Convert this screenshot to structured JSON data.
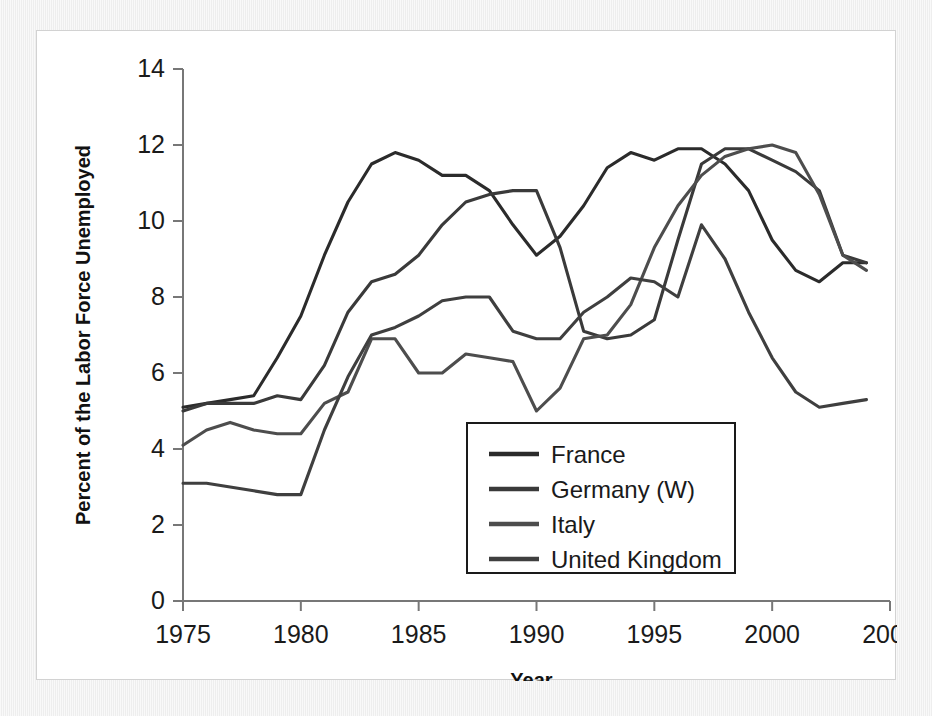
{
  "figure": {
    "background_color": "#ffffff",
    "page_color": "#f2f2f2",
    "frame_color": "#d2d2d2"
  },
  "chart_data": {
    "type": "line",
    "title": "",
    "subtitle": "",
    "xlabel": "Year",
    "ylabel": "Percent of the Labor Force Unemployed",
    "xlim": [
      1975,
      2005
    ],
    "ylim": [
      0,
      14
    ],
    "xticks": [
      1975,
      1980,
      1985,
      1990,
      1995,
      2000,
      2005
    ],
    "xtick_labels": [
      "1975",
      "1980",
      "1985",
      "1990",
      "1995",
      "2000",
      "2005"
    ],
    "yticks": [
      0,
      2,
      4,
      6,
      8,
      10,
      12,
      14
    ],
    "ytick_labels": [
      "0",
      "2",
      "4",
      "6",
      "8",
      "10",
      "12",
      "14"
    ],
    "grid": false,
    "legend_position": "lower right",
    "x": [
      1975,
      1976,
      1977,
      1978,
      1979,
      1980,
      1981,
      1982,
      1983,
      1984,
      1985,
      1986,
      1987,
      1988,
      1989,
      1990,
      1991,
      1992,
      1993,
      1994,
      1995,
      1996,
      1997,
      1998,
      1999,
      2000,
      2001,
      2002,
      2003,
      2004
    ],
    "series": [
      {
        "name": "France",
        "color": "#2b2b2b",
        "values": [
          5.1,
          5.2,
          5.3,
          5.4,
          6.4,
          7.5,
          9.1,
          10.5,
          11.5,
          11.8,
          11.6,
          11.2,
          11.2,
          10.8,
          9.9,
          9.1,
          9.6,
          10.4,
          11.4,
          11.8,
          11.6,
          11.9,
          11.9,
          11.5,
          10.8,
          9.5,
          8.7,
          8.4,
          8.9,
          8.9
        ],
        "linewidth": 3.1,
        "dash": "none"
      },
      {
        "name": "Germany (W)",
        "color": "#3a3a3a",
        "values": [
          5.0,
          5.2,
          5.2,
          5.2,
          5.4,
          5.3,
          6.2,
          7.6,
          8.4,
          8.6,
          9.1,
          9.9,
          10.5,
          10.7,
          10.8,
          10.8,
          9.3,
          7.1,
          6.9,
          7.0,
          7.4,
          9.5,
          11.5,
          11.9,
          11.9,
          11.6,
          11.3,
          10.8,
          9.1,
          8.9
        ],
        "linewidth": 3.1,
        "dash": "none"
      },
      {
        "name": "Italy",
        "color": "#4d4d4d",
        "values": [
          4.1,
          4.5,
          4.7,
          4.5,
          4.4,
          4.4,
          5.2,
          5.5,
          6.9,
          6.9,
          6.0,
          6.0,
          6.5,
          6.4,
          6.3,
          5.0,
          5.6,
          6.9,
          7.0,
          7.8,
          9.3,
          10.4,
          11.2,
          11.7,
          11.9,
          12.0,
          11.8,
          10.7,
          9.1,
          8.7
        ],
        "linewidth": 3.1,
        "dash": "none"
      },
      {
        "name": "United Kingdom",
        "color": "#3f3f3f",
        "values": [
          3.1,
          3.1,
          3.0,
          2.9,
          2.8,
          2.8,
          4.5,
          5.9,
          7.0,
          7.2,
          7.5,
          7.9,
          8.0,
          8.0,
          7.1,
          6.9,
          6.9,
          7.6,
          8.0,
          8.5,
          8.4,
          8.0,
          9.9,
          9.0,
          7.6,
          6.4,
          5.5,
          5.1,
          5.2,
          5.3
        ],
        "linewidth": 3.1,
        "dash": "none"
      }
    ],
    "legend": [
      {
        "label": "France",
        "color": "#2b2b2b"
      },
      {
        "label": "Germany (W)",
        "color": "#3a3a3a"
      },
      {
        "label": "Italy",
        "color": "#4d4d4d"
      },
      {
        "label": "United Kingdom",
        "color": "#3f3f3f"
      }
    ]
  }
}
